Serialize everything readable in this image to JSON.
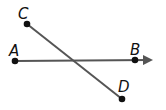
{
  "diagram": {
    "line_color": "#555555",
    "point_color": "#111111",
    "points": [
      {
        "label": "A",
        "x": 15,
        "y": 61
      },
      {
        "label": "B",
        "x": 135,
        "y": 60
      },
      {
        "label": "C",
        "x": 27,
        "y": 24
      },
      {
        "label": "D",
        "x": 122,
        "y": 99
      }
    ],
    "ray": {
      "from": "A",
      "through": "B",
      "label": "ray AB"
    },
    "segment": {
      "from": "C",
      "to": "D",
      "label": "segment CD"
    }
  }
}
